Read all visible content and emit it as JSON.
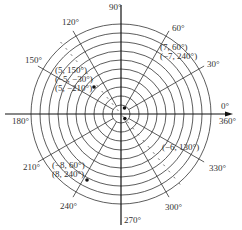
{
  "diagram": {
    "type": "polar-grid",
    "center": [
      121,
      114
    ],
    "ring_count": 10,
    "ring_step_px": 9,
    "inner_circle_radius_px": 9,
    "radial_step_deg": 30,
    "colors": {
      "grid": "#333333",
      "background": "#ffffff",
      "point": "#111111"
    },
    "angle_labels": [
      {
        "text": "0°",
        "x": 221,
        "y": 109
      },
      {
        "text": "30°",
        "x": 207,
        "y": 67
      },
      {
        "text": "60°",
        "x": 172,
        "y": 31
      },
      {
        "text": "90°",
        "x": 109,
        "y": 10
      },
      {
        "text": "120°",
        "x": 62,
        "y": 25
      },
      {
        "text": "150°",
        "x": 25,
        "y": 63
      },
      {
        "text": "180°",
        "x": 12,
        "y": 124
      },
      {
        "text": "210°",
        "x": 23,
        "y": 170
      },
      {
        "text": "240°",
        "x": 60,
        "y": 209
      },
      {
        "text": "270°",
        "x": 124,
        "y": 223
      },
      {
        "text": "300°",
        "x": 165,
        "y": 210
      },
      {
        "text": "330°",
        "x": 209,
        "y": 171
      },
      {
        "text": "360°",
        "x": 219,
        "y": 124
      }
    ],
    "dashed_line_deg": 130,
    "points": [
      {
        "r": 7,
        "deg": 60,
        "labels": [
          "(7, 60°)",
          "(−7, 240°)"
        ],
        "label_x": 160,
        "label_y": 50
      },
      {
        "r": 5,
        "deg": 150,
        "labels": [
          "(5, 150°)",
          "(−5, −30°)",
          "(5, −210°)"
        ],
        "label_x": 55,
        "label_y": 73,
        "dot": [
          94,
          87
        ]
      },
      {
        "r": 8,
        "deg": 240,
        "labels": [
          "(−8, 60°)",
          "(8, 240°)"
        ],
        "label_x": 52,
        "label_y": 168,
        "dot": [
          87,
          180
        ]
      },
      {
        "r": -6,
        "deg": 130,
        "labels": [
          "(−6, 130°)"
        ],
        "label_x": 162,
        "label_y": 150
      }
    ]
  }
}
